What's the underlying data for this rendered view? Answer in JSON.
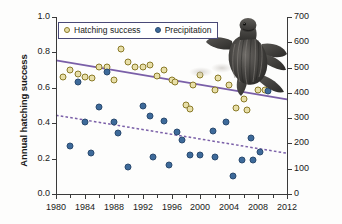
{
  "chart_data": {
    "type": "scatter",
    "title": "",
    "xlabel": "",
    "ylabel": "Annual hatching success",
    "ylabel_right": "Seasonal precipitation (mm)",
    "xlim": [
      1980,
      2012
    ],
    "ylim": [
      0.0,
      1.0
    ],
    "ylim_right": [
      0,
      700
    ],
    "grid": false,
    "legend_position": "top-left",
    "xticks": [
      "1980",
      "1984",
      "1988",
      "1992",
      "1996",
      "2000",
      "2004",
      "2008",
      "2012"
    ],
    "xtick_values": [
      1980,
      1984,
      1988,
      1992,
      1996,
      2000,
      2004,
      2008,
      2012
    ],
    "x_minor_tick_values": [
      1982,
      1986,
      1990,
      1994,
      1998,
      2002,
      2006,
      2010
    ],
    "yticks_left": [
      "0.0",
      "0.2",
      "0.4",
      "0.6",
      "0.8",
      "1.0"
    ],
    "ytick_values_left": [
      0.0,
      0.2,
      0.4,
      0.6,
      0.8,
      1.0
    ],
    "yticks_right": [
      "0",
      "100",
      "200",
      "300",
      "400",
      "500",
      "600",
      "700"
    ],
    "ytick_values_right": [
      0,
      100,
      200,
      300,
      400,
      500,
      600,
      700
    ],
    "series": [
      {
        "name": "Hatching success",
        "axis": "left",
        "marker": "open-circle",
        "color": "#e8dfa8",
        "edge_color": "#8a7a28",
        "points": [
          {
            "x": 1981,
            "y": 0.66
          },
          {
            "x": 1982,
            "y": 0.7
          },
          {
            "x": 1983,
            "y": 0.68
          },
          {
            "x": 1984,
            "y": 0.66
          },
          {
            "x": 1985,
            "y": 0.655
          },
          {
            "x": 1986,
            "y": 0.72
          },
          {
            "x": 1987,
            "y": 0.715
          },
          {
            "x": 1988,
            "y": 0.645
          },
          {
            "x": 1989,
            "y": 0.82
          },
          {
            "x": 1990,
            "y": 0.745
          },
          {
            "x": 1991,
            "y": 0.72
          },
          {
            "x": 1992,
            "y": 0.715
          },
          {
            "x": 1993,
            "y": 0.73
          },
          {
            "x": 1994,
            "y": 0.665
          },
          {
            "x": 1995,
            "y": 0.7
          },
          {
            "x": 1996,
            "y": 0.645
          },
          {
            "x": 1996.5,
            "y": 0.635
          },
          {
            "x": 1998,
            "y": 0.505
          },
          {
            "x": 1998.5,
            "y": 0.48
          },
          {
            "x": 1999,
            "y": 0.615
          },
          {
            "x": 2000,
            "y": 0.67
          },
          {
            "x": 2002,
            "y": 0.59
          },
          {
            "x": 2002.5,
            "y": 0.655
          },
          {
            "x": 2004,
            "y": 0.615
          },
          {
            "x": 2005,
            "y": 0.485
          },
          {
            "x": 2006,
            "y": 0.535
          },
          {
            "x": 2006.5,
            "y": 0.475
          },
          {
            "x": 2008,
            "y": 0.59
          },
          {
            "x": 2009,
            "y": 0.585
          }
        ]
      },
      {
        "name": "Precipitation",
        "axis": "right",
        "marker": "filled-circle",
        "color": "#3d6a9a",
        "edge_color": "#2b4b70",
        "points": [
          {
            "x": 1982,
            "y": 0.27
          },
          {
            "x": 1983,
            "y": 0.635
          },
          {
            "x": 1984,
            "y": 0.405
          },
          {
            "x": 1984.8,
            "y": 0.23
          },
          {
            "x": 1986,
            "y": 0.49
          },
          {
            "x": 1987,
            "y": 0.69
          },
          {
            "x": 1988,
            "y": 0.405
          },
          {
            "x": 1988.6,
            "y": 0.345
          },
          {
            "x": 1990,
            "y": 0.155
          },
          {
            "x": 1992,
            "y": 0.5
          },
          {
            "x": 1993,
            "y": 0.44
          },
          {
            "x": 1993.5,
            "y": 0.21
          },
          {
            "x": 1995,
            "y": 0.41
          },
          {
            "x": 1995.7,
            "y": 0.165
          },
          {
            "x": 1996.7,
            "y": 0.35
          },
          {
            "x": 1997.5,
            "y": 0.305
          },
          {
            "x": 1998.5,
            "y": 0.22
          },
          {
            "x": 2000,
            "y": 0.22
          },
          {
            "x": 2001.7,
            "y": 0.355
          },
          {
            "x": 2002,
            "y": 0.21
          },
          {
            "x": 2003.6,
            "y": 0.405
          },
          {
            "x": 2004.5,
            "y": 0.1
          },
          {
            "x": 2005.8,
            "y": 0.19
          },
          {
            "x": 2007,
            "y": 0.315
          },
          {
            "x": 2007.3,
            "y": 0.19
          },
          {
            "x": 2008.3,
            "y": 0.24
          },
          {
            "x": 2009.3,
            "y": 0.58
          }
        ]
      }
    ],
    "trendlines": [
      {
        "name": "Hatching success trend",
        "style": "solid",
        "color": "#7a5fa8",
        "x_start": 1980,
        "y_start": 0.755,
        "x_end": 2012,
        "y_end": 0.535,
        "axis": "left"
      },
      {
        "name": "Precipitation trend",
        "style": "dashed",
        "color": "#7a5fa8",
        "x_start": 1980,
        "y_start": 0.445,
        "x_end": 2012,
        "y_end": 0.23,
        "axis": "left"
      }
    ],
    "annotations": [
      {
        "name": "turtle-hatchling-photo",
        "description": "leatherback sea turtle hatchling"
      }
    ]
  },
  "legend": {
    "items": [
      {
        "label": "Hatching success",
        "swatch": "open-circle-yellow"
      },
      {
        "label": "Precipitation",
        "swatch": "filled-circle-blue"
      }
    ]
  }
}
